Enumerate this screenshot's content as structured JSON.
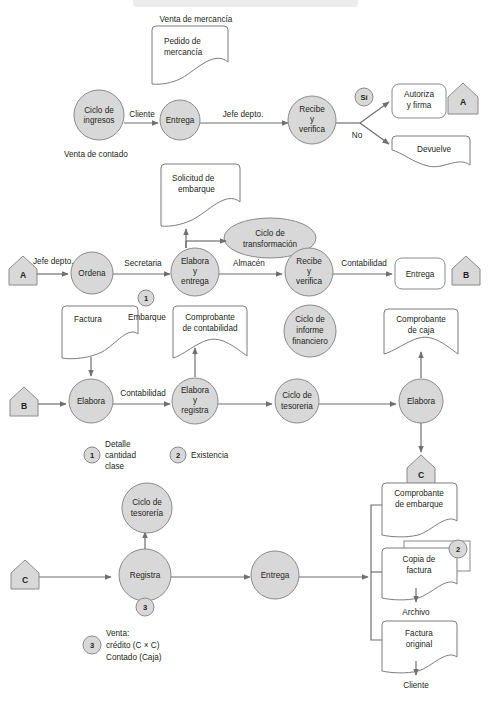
{
  "diagram": {
    "colors": {
      "node_fill": "#d8d8d8",
      "node_stroke": "#8a8a8a",
      "doc_fill": "#ffffff",
      "line": "#6f6f6f",
      "text": "#231f20"
    },
    "row1": {
      "caption_top": "Venta de mercancía",
      "caption_bottom": "Venta de contado",
      "doc_pedido": "Pedido de\nmercancía",
      "doc_pedido_line1": "Pedido de",
      "doc_pedido_line2": "mercancía",
      "node_ciclo_ingresos_l1": "Ciclo de",
      "node_ciclo_ingresos_l2": "ingresos",
      "edge_cliente": "Cliente",
      "node_entrega": "Entrega",
      "edge_jefe_depto": "Jefe depto.",
      "node_recibe_l1": "Recibe",
      "node_recibe_l2": "y",
      "node_recibe_l3": "verifica",
      "badge_si": "Sí",
      "edge_no": "No",
      "node_autoriza_l1": "Autoriza",
      "node_autoriza_l2": "y firma",
      "doc_devuelve": "Devuelve",
      "connector_a": "A"
    },
    "row2": {
      "connector_a": "A",
      "edge_jefe_depto": "Jefe depto.",
      "node_ordena": "Ordena",
      "edge_secretaria": "Secretaria",
      "node_elabora_l1": "Elabora",
      "node_elabora_l2": "y",
      "node_elabora_l3": "entrega",
      "edge_almacen": "Almacén",
      "node_recibe_l1": "Recibe",
      "node_recibe_l2": "y",
      "node_recibe_l3": "verifica",
      "edge_contabilidad": "Contabilidad",
      "node_entrega": "Entrega",
      "connector_b": "B",
      "doc_solicitud_l1": "Solicitud de",
      "doc_solicitud_l2": "embarque",
      "node_transformacion_l1": "Ciclo de",
      "node_transformacion_l2": "transformación",
      "badge_1": "1"
    },
    "row3": {
      "connector_b": "B",
      "doc_factura": "Factura",
      "label_embarque": "Embarque",
      "doc_comprobante_cont_l1": "Comprobante",
      "doc_comprobante_cont_l2": "de contabilidad",
      "node_informe_l1": "Ciclo de",
      "node_informe_l2": "informe",
      "node_informe_l3": "financiero",
      "doc_comprobante_caja_l1": "Comprobante",
      "doc_comprobante_caja_l2": "de caja",
      "node_elabora": "Elabora",
      "edge_contabilidad": "Contabilidad",
      "node_elabora_registra_l1": "Elabora",
      "node_elabora_registra_l2": "y",
      "node_elabora_registra_l3": "registra",
      "node_tesoreria_l1": "Ciclo de",
      "node_tesoreria_l2": "tesoreria",
      "node_elabora2": "Elabora",
      "connector_c": "C",
      "legend1_badge": "1",
      "legend1_l1": "Detalle",
      "legend1_l2": "cantidad",
      "legend1_l3": "clase",
      "legend2_badge": "2",
      "legend2_text": "Existencia"
    },
    "row4": {
      "connector_c": "C",
      "node_tesoreria_l1": "Ciclo de",
      "node_tesoreria_l2": "tesorería",
      "node_registra": "Registra",
      "badge_3": "3",
      "node_entrega": "Entrega",
      "doc_comprobante_emb_l1": "Comprobante",
      "doc_comprobante_emb_l2": "de embarque",
      "doc_copia_factura_l1": "Copia de",
      "doc_copia_factura_l2": "factura",
      "badge_2": "2",
      "label_archivo": "Archivo",
      "doc_factura_original_l1": "Factura",
      "doc_factura_original_l2": "original",
      "label_cliente": "Cliente",
      "connector_c_top": "C",
      "legend3_badge": "3",
      "legend3_l1": "Venta:",
      "legend3_l2": "crédito (C × C)",
      "legend3_l3": "Contado (Caja)"
    }
  }
}
